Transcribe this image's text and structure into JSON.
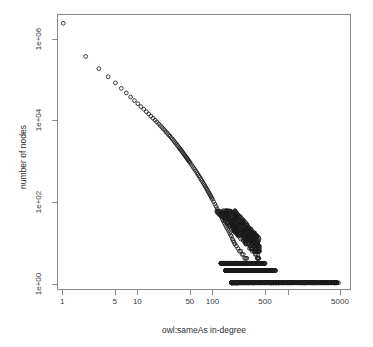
{
  "figure": {
    "background_color": "#ffffff",
    "frame_color": "#8a8a8a",
    "marker_color": "#1a1a1a"
  },
  "axes": {
    "x_title": "owl:sameAs in-degree",
    "y_title": "number of nodes",
    "x_ticks": [
      {
        "value": 1,
        "label": "1"
      },
      {
        "value": 5,
        "label": "5"
      },
      {
        "value": 10,
        "label": "10"
      },
      {
        "value": 50,
        "label": "50"
      },
      {
        "value": 100,
        "label": "100"
      },
      {
        "value": 500,
        "label": "500"
      },
      {
        "value": 1000,
        "label": ""
      },
      {
        "value": 5000,
        "label": "5000"
      }
    ],
    "y_ticks": [
      {
        "value": 1,
        "label": "1e+00"
      },
      {
        "value": 100,
        "label": "1e+02"
      },
      {
        "value": 10000,
        "label": "1e+04"
      },
      {
        "value": 1000000,
        "label": "1e+06"
      }
    ]
  },
  "chart_data": {
    "type": "scatter",
    "title": "",
    "subtitle": "",
    "xlabel": "owl:sameAs in-degree",
    "ylabel": "number of nodes",
    "xscale": "log",
    "yscale": "log",
    "xlim": [
      0.85,
      7000
    ],
    "ylim": [
      0.7,
      4000000
    ],
    "grid": false,
    "legend": null,
    "marker": "open-circle",
    "marker_size_px": 4,
    "xticks": [
      1,
      5,
      10,
      50,
      100,
      500,
      1000,
      5000
    ],
    "xticklabels": [
      "1",
      "5",
      "10",
      "50",
      "100",
      "500",
      "",
      "5000"
    ],
    "yticks": [
      1,
      100,
      10000,
      1000000
    ],
    "yticklabels": [
      "1e+00",
      "1e+02",
      "1e+04",
      "1e+06"
    ],
    "annotations": [],
    "series": [
      {
        "name": "owl:sameAs in-degree distribution",
        "x": [
          1,
          2,
          3,
          4,
          5,
          6,
          7,
          8,
          9,
          10,
          11,
          12,
          13,
          14,
          15,
          16,
          17,
          18,
          19,
          20,
          21,
          22,
          23,
          24,
          25,
          26,
          27,
          28,
          29,
          30,
          31,
          32,
          33,
          34,
          35,
          36,
          37,
          38,
          39,
          40,
          41,
          42,
          43,
          44,
          45,
          46,
          47,
          48,
          49,
          50,
          52,
          54,
          56,
          58,
          60,
          62,
          64,
          66,
          68,
          70,
          72,
          74,
          76,
          78,
          80,
          82,
          84,
          86,
          88,
          90,
          92,
          94,
          96,
          98,
          100,
          104,
          108,
          112,
          116,
          120,
          124,
          128,
          132,
          136,
          140,
          145,
          150,
          155,
          160,
          165,
          170,
          175,
          180,
          185,
          190,
          195,
          200,
          210,
          220,
          230,
          240,
          250,
          260,
          270,
          280,
          290,
          300,
          310,
          320,
          330,
          340,
          350,
          360,
          370,
          380,
          390,
          400,
          420,
          440,
          460,
          480,
          500,
          520,
          540,
          560,
          580,
          600,
          620,
          640,
          660,
          680,
          700,
          720,
          740,
          760,
          780,
          800,
          850,
          900,
          950,
          1000,
          1050,
          1100,
          1150,
          1200,
          1300,
          1400,
          1500,
          1600,
          1700,
          1800,
          1900,
          2000,
          2200,
          2400,
          2600,
          2800,
          3000,
          3400,
          4000,
          4700
        ],
        "y": [
          2500000,
          380000,
          190000,
          120000,
          85000,
          62000,
          48000,
          38000,
          31000,
          26000,
          22000,
          19000,
          16500,
          14500,
          12800,
          11400,
          10200,
          9200,
          8300,
          7500,
          6800,
          6200,
          5700,
          5200,
          4800,
          4400,
          4100,
          3800,
          3500,
          3250,
          3000,
          2800,
          2600,
          2420,
          2260,
          2110,
          1980,
          1850,
          1740,
          1630,
          1530,
          1440,
          1360,
          1280,
          1210,
          1140,
          1080,
          1020,
          970,
          920,
          830,
          750,
          680,
          620,
          565,
          515,
          470,
          430,
          395,
          362,
          333,
          306,
          282,
          260,
          240,
          222,
          205,
          190,
          176,
          163,
          152,
          141,
          131,
          122,
          114,
          99,
          87,
          76,
          67,
          59,
          53,
          47,
          42,
          37,
          33,
          29,
          26,
          23,
          21,
          19,
          17,
          15,
          14,
          12,
          11,
          10,
          9,
          8,
          7,
          6,
          6,
          5,
          5,
          4,
          4,
          4,
          3,
          3,
          3,
          3,
          3,
          2,
          2,
          2,
          2,
          2,
          2,
          2,
          2,
          2,
          2,
          2,
          1,
          2,
          1,
          2,
          1,
          1,
          1,
          1,
          1,
          1,
          1,
          1,
          1,
          1,
          1,
          1,
          1,
          1,
          1,
          1,
          1,
          1,
          1,
          1,
          1,
          1,
          1,
          1,
          1,
          1,
          1,
          1,
          1,
          1,
          1,
          1,
          1,
          1,
          1
        ]
      }
    ],
    "scatter_bands": {
      "note": "Dense saturated horizontal bands of coincident points at low counts",
      "y1_x_range": [
        180,
        4700
      ],
      "y2_x_range": [
        150,
        700
      ],
      "y3_x_range": [
        130,
        520
      ]
    }
  }
}
